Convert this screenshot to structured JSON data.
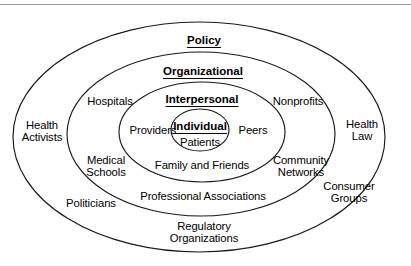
{
  "diagram": {
    "type": "concentric-ellipse",
    "frame": {
      "top_rule_color": "#9a9a9a"
    },
    "levels": [
      {
        "id": "policy",
        "label": "Policy",
        "ring_index": 4,
        "style": "bold-underline",
        "x": 204,
        "y": 39
      },
      {
        "id": "organizational",
        "label": "Organizational",
        "ring_index": 3,
        "style": "bold-underline",
        "x": 203,
        "y": 70
      },
      {
        "id": "interpersonal",
        "label": "Interpersonal",
        "ring_index": 2,
        "style": "bold-underline",
        "x": 202,
        "y": 98
      },
      {
        "id": "individual",
        "label": "Individual",
        "ring_index": 1,
        "style": "bold-underline",
        "x": 200,
        "y": 125
      }
    ],
    "actors": [
      {
        "id": "patients",
        "lines": [
          "Patients"
        ],
        "ring": "individual",
        "x": 200,
        "y": 142
      },
      {
        "id": "providers",
        "lines": [
          "Providers"
        ],
        "ring": "interpersonal",
        "x": 153,
        "y": 130
      },
      {
        "id": "peers",
        "lines": [
          "Peers"
        ],
        "ring": "interpersonal",
        "x": 253,
        "y": 130
      },
      {
        "id": "family-and-friends",
        "lines": [
          "Family and Friends"
        ],
        "ring": "interpersonal",
        "x": 202,
        "y": 165
      },
      {
        "id": "hospitals",
        "lines": [
          "Hospitals"
        ],
        "ring": "organizational",
        "x": 110,
        "y": 101
      },
      {
        "id": "nonprofits",
        "lines": [
          "Nonprofits"
        ],
        "ring": "organizational",
        "x": 298,
        "y": 101
      },
      {
        "id": "medical-schools",
        "lines": [
          "Medical",
          "Schools"
        ],
        "ring": "organizational",
        "x": 106,
        "y": 166
      },
      {
        "id": "community-networks",
        "lines": [
          "Community",
          "Networks"
        ],
        "ring": "organizational",
        "x": 301,
        "y": 166
      },
      {
        "id": "professional-associations",
        "lines": [
          "Professional Associations"
        ],
        "ring": "organizational",
        "x": 203,
        "y": 196
      },
      {
        "id": "health-activists",
        "lines": [
          "Health",
          "Activists"
        ],
        "ring": "policy",
        "x": 42,
        "y": 131
      },
      {
        "id": "health-law",
        "lines": [
          "Health",
          "Law"
        ],
        "ring": "policy",
        "x": 362,
        "y": 130
      },
      {
        "id": "politicians",
        "lines": [
          "Politicians"
        ],
        "ring": "policy",
        "x": 91,
        "y": 203
      },
      {
        "id": "consumer-groups",
        "lines": [
          "Consumer",
          "Groups"
        ],
        "ring": "policy",
        "x": 349,
        "y": 192
      },
      {
        "id": "regulatory-organizations",
        "lines": [
          "Regulatory",
          "Organizations"
        ],
        "ring": "policy",
        "x": 204,
        "y": 232
      }
    ],
    "rings": [
      {
        "id": "ring-policy",
        "name": "policy-ellipse",
        "cx": 199,
        "cy": 137,
        "rx": 186,
        "ry": 115
      },
      {
        "id": "ring-organizational",
        "name": "organizational-ellipse",
        "cx": 201,
        "cy": 134,
        "rx": 134,
        "ry": 82
      },
      {
        "id": "ring-interpersonal",
        "name": "interpersonal-ellipse",
        "cx": 202,
        "cy": 132,
        "rx": 83,
        "ry": 50
      },
      {
        "id": "ring-individual",
        "name": "individual-ellipse",
        "cx": 200,
        "cy": 130,
        "rx": 29,
        "ry": 21
      }
    ]
  }
}
